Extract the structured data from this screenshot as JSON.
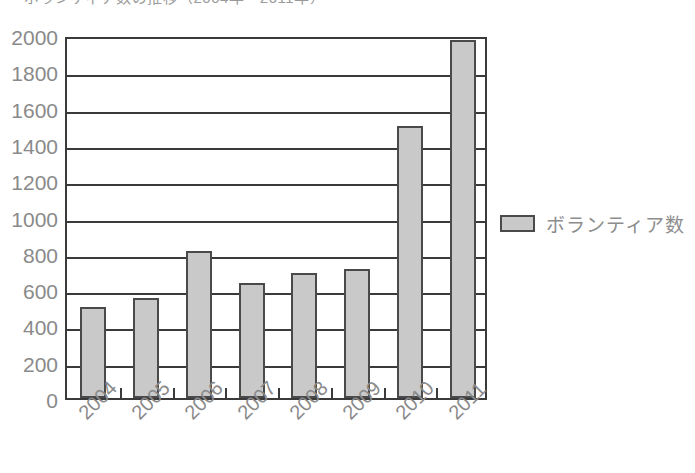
{
  "title_clipped": "ボランティア数の推移（2004年〜2011年）",
  "legend": {
    "swatch_name": "legend-color-swatch",
    "label": "ボランティア数",
    "color": "#c9c9c9",
    "border_color": "#4a4a4a",
    "position": "right"
  },
  "chart_data": {
    "type": "bar",
    "title": "",
    "xlabel": "",
    "ylabel": "",
    "categories": [
      "2004",
      "2005",
      "2006",
      "2007",
      "2008",
      "2009",
      "2010",
      "2011"
    ],
    "values": [
      500,
      550,
      810,
      635,
      690,
      710,
      1500,
      1970
    ],
    "series": [
      {
        "name": "ボランティア数",
        "values": [
          500,
          550,
          810,
          635,
          690,
          710,
          1500,
          1970
        ],
        "color": "#c9c9c9"
      }
    ],
    "ylim": [
      0,
      2000
    ],
    "ytick_step": 200,
    "yticks": [
      2000,
      1800,
      1600,
      1400,
      1200,
      1000,
      800,
      600,
      400,
      200,
      0
    ],
    "ytick_labels": [
      "2000",
      "1800",
      "1600",
      "1400",
      "1200",
      "1000",
      "800",
      "600",
      "400",
      "200",
      "0"
    ],
    "grid": true,
    "grid_axis": "y",
    "legend": true,
    "legend_position": "right",
    "xtick_rotation": -45
  }
}
